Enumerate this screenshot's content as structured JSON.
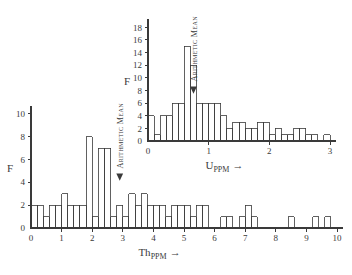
{
  "figure": {
    "background": "#ffffff",
    "ink_color": "#3a3a3a"
  },
  "chart_data": [
    {
      "id": "uranium-histogram",
      "type": "bar",
      "title": "",
      "xlabel": "U",
      "xlabel_sub": "PPM",
      "xlabel_suffix": "→",
      "ylabel": "F",
      "xlim": [
        0,
        3
      ],
      "ylim": [
        0,
        19
      ],
      "xticks": [
        0,
        1,
        2,
        3
      ],
      "xticklabels": [
        "0",
        "1",
        "2",
        "3"
      ],
      "yticks": [
        2,
        4,
        6,
        8,
        10,
        12,
        14,
        16,
        18
      ],
      "yticklabels": [
        "2",
        "4",
        "6",
        "8",
        "10",
        "12",
        "14",
        "16",
        "18"
      ],
      "bin_width": 0.1,
      "grid": false,
      "legend": false,
      "annotation": {
        "text": "Arithmetic Mean",
        "x": 0.75,
        "marker": "down-arrow"
      },
      "bins": [
        {
          "x0": 0.0,
          "x1": 0.1,
          "value": 4
        },
        {
          "x0": 0.1,
          "x1": 0.2,
          "value": 1
        },
        {
          "x0": 0.2,
          "x1": 0.3,
          "value": 4
        },
        {
          "x0": 0.3,
          "x1": 0.4,
          "value": 4
        },
        {
          "x0": 0.4,
          "x1": 0.5,
          "value": 6
        },
        {
          "x0": 0.5,
          "x1": 0.6,
          "value": 6
        },
        {
          "x0": 0.6,
          "x1": 0.7,
          "value": 15
        },
        {
          "x0": 0.7,
          "x1": 0.8,
          "value": 12
        },
        {
          "x0": 0.8,
          "x1": 0.9,
          "value": 6
        },
        {
          "x0": 0.9,
          "x1": 1.0,
          "value": 6
        },
        {
          "x0": 1.0,
          "x1": 1.1,
          "value": 6
        },
        {
          "x0": 1.1,
          "x1": 1.2,
          "value": 6
        },
        {
          "x0": 1.2,
          "x1": 1.3,
          "value": 4
        },
        {
          "x0": 1.3,
          "x1": 1.4,
          "value": 2
        },
        {
          "x0": 1.4,
          "x1": 1.5,
          "value": 3
        },
        {
          "x0": 1.5,
          "x1": 1.6,
          "value": 3
        },
        {
          "x0": 1.6,
          "x1": 1.7,
          "value": 2
        },
        {
          "x0": 1.7,
          "x1": 1.8,
          "value": 2
        },
        {
          "x0": 1.8,
          "x1": 1.9,
          "value": 3
        },
        {
          "x0": 1.9,
          "x1": 2.0,
          "value": 3
        },
        {
          "x0": 2.0,
          "x1": 2.1,
          "value": 1
        },
        {
          "x0": 2.1,
          "x1": 2.2,
          "value": 2
        },
        {
          "x0": 2.2,
          "x1": 2.3,
          "value": 1
        },
        {
          "x0": 2.3,
          "x1": 2.4,
          "value": 1
        },
        {
          "x0": 2.4,
          "x1": 2.5,
          "value": 2
        },
        {
          "x0": 2.5,
          "x1": 2.6,
          "value": 2
        },
        {
          "x0": 2.6,
          "x1": 2.7,
          "value": 1
        },
        {
          "x0": 2.7,
          "x1": 2.8,
          "value": 1
        },
        {
          "x0": 2.9,
          "x1": 3.0,
          "value": 1
        },
        {
          "x0": 3.1,
          "x1": 3.2,
          "value": 1
        }
      ]
    },
    {
      "id": "thorium-histogram",
      "type": "bar",
      "title": "",
      "xlabel": "Th",
      "xlabel_sub": "PPM",
      "xlabel_suffix": "→",
      "ylabel": "F",
      "xlim": [
        0,
        10
      ],
      "ylim": [
        0,
        10.5
      ],
      "xticks": [
        0,
        1,
        2,
        3,
        4,
        5,
        6,
        7,
        8,
        9,
        10
      ],
      "xticklabels": [
        "0",
        "1",
        "2",
        "3",
        "4",
        "5",
        "6",
        "7",
        "8",
        "9",
        "10"
      ],
      "yticks": [
        2,
        4,
        6,
        8,
        10
      ],
      "yticklabels": [
        "2",
        "4",
        "6",
        "8",
        "10"
      ],
      "bin_width": 0.2,
      "grid": false,
      "legend": false,
      "annotation": {
        "text": "Arithmetic Mean",
        "x": 2.9,
        "marker": "down-arrow"
      },
      "bins": [
        {
          "x0": 0.0,
          "x1": 0.2,
          "value": 2
        },
        {
          "x0": 0.2,
          "x1": 0.4,
          "value": 2
        },
        {
          "x0": 0.4,
          "x1": 0.6,
          "value": 1
        },
        {
          "x0": 0.6,
          "x1": 0.8,
          "value": 2
        },
        {
          "x0": 0.8,
          "x1": 1.0,
          "value": 2
        },
        {
          "x0": 1.0,
          "x1": 1.2,
          "value": 3
        },
        {
          "x0": 1.2,
          "x1": 1.4,
          "value": 2
        },
        {
          "x0": 1.4,
          "x1": 1.6,
          "value": 2
        },
        {
          "x0": 1.6,
          "x1": 1.8,
          "value": 2
        },
        {
          "x0": 1.8,
          "x1": 2.0,
          "value": 8
        },
        {
          "x0": 2.0,
          "x1": 2.2,
          "value": 1
        },
        {
          "x0": 2.2,
          "x1": 2.4,
          "value": 7
        },
        {
          "x0": 2.4,
          "x1": 2.6,
          "value": 7
        },
        {
          "x0": 2.6,
          "x1": 2.8,
          "value": 1
        },
        {
          "x0": 2.8,
          "x1": 3.0,
          "value": 2
        },
        {
          "x0": 3.0,
          "x1": 3.2,
          "value": 1
        },
        {
          "x0": 3.2,
          "x1": 3.4,
          "value": 3
        },
        {
          "x0": 3.4,
          "x1": 3.6,
          "value": 2
        },
        {
          "x0": 3.6,
          "x1": 3.8,
          "value": 3
        },
        {
          "x0": 3.8,
          "x1": 4.0,
          "value": 2
        },
        {
          "x0": 4.0,
          "x1": 4.2,
          "value": 2
        },
        {
          "x0": 4.2,
          "x1": 4.4,
          "value": 2
        },
        {
          "x0": 4.4,
          "x1": 4.6,
          "value": 1
        },
        {
          "x0": 4.6,
          "x1": 4.8,
          "value": 2
        },
        {
          "x0": 4.8,
          "x1": 5.0,
          "value": 2
        },
        {
          "x0": 5.0,
          "x1": 5.2,
          "value": 2
        },
        {
          "x0": 5.2,
          "x1": 5.4,
          "value": 1
        },
        {
          "x0": 5.4,
          "x1": 5.6,
          "value": 2
        },
        {
          "x0": 5.6,
          "x1": 5.8,
          "value": 2
        },
        {
          "x0": 6.2,
          "x1": 6.4,
          "value": 1
        },
        {
          "x0": 6.4,
          "x1": 6.6,
          "value": 1
        },
        {
          "x0": 6.8,
          "x1": 7.0,
          "value": 1
        },
        {
          "x0": 7.0,
          "x1": 7.2,
          "value": 2
        },
        {
          "x0": 7.2,
          "x1": 7.4,
          "value": 1
        },
        {
          "x0": 8.4,
          "x1": 8.6,
          "value": 1
        },
        {
          "x0": 9.2,
          "x1": 9.4,
          "value": 1
        },
        {
          "x0": 9.6,
          "x1": 9.8,
          "value": 1
        }
      ]
    }
  ]
}
